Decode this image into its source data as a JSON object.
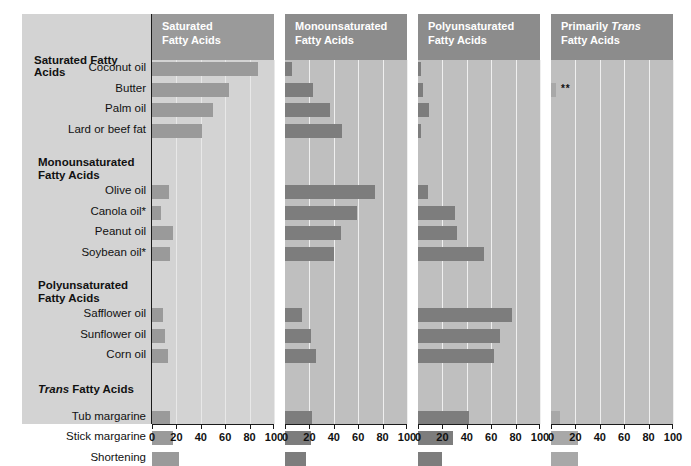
{
  "chart_data": {
    "type": "bar",
    "title": "",
    "orientation": "horizontal",
    "panels": [
      {
        "key": "saturated",
        "title_line1": "Saturated",
        "title_line2": "Fatty Acids",
        "xlabel": "",
        "xlim": [
          0,
          100
        ],
        "ticks": [
          0,
          20,
          40,
          60,
          80,
          100
        ]
      },
      {
        "key": "monounsaturated",
        "title_line1": "Monounsaturated",
        "title_line2": "Fatty Acids",
        "xlabel": "",
        "xlim": [
          0,
          100
        ],
        "ticks": [
          0,
          20,
          40,
          60,
          80,
          100
        ]
      },
      {
        "key": "polyunsaturated",
        "title_line1": "Polyunsaturated",
        "title_line2": "Fatty Acids",
        "xlabel": "",
        "xlim": [
          0,
          100
        ],
        "ticks": [
          0,
          20,
          40,
          60,
          80,
          100
        ]
      },
      {
        "key": "trans",
        "title_line1_pre": "Primarily ",
        "title_line1_italic": "Trans",
        "title_line2": "Fatty Acids",
        "xlabel": "",
        "xlim": [
          0,
          100
        ],
        "ticks": [
          0,
          20,
          40,
          60,
          80,
          100
        ]
      }
    ],
    "groups": [
      {
        "label": "Saturated Fatty Acids",
        "italic_word": "",
        "items": [
          "Coconut oil",
          "Butter",
          "Palm oil",
          "Lard or beef fat"
        ]
      },
      {
        "label": "Monounsaturated Fatty Acids",
        "italic_word": "",
        "items": [
          "Olive oil",
          "Canola oil*",
          "Peanut oil",
          "Soybean oil*"
        ]
      },
      {
        "label": "Polyunsaturated Fatty Acids",
        "italic_word": "",
        "items": [
          "Safflower oil",
          "Sunflower oil",
          "Corn oil"
        ]
      },
      {
        "label": "Trans Fatty Acids",
        "italic_word": "Trans",
        "items": [
          "Tub margarine",
          "Stick margarine",
          "Shortening"
        ]
      }
    ],
    "categories": [
      "Coconut oil",
      "Butter",
      "Palm oil",
      "Lard or beef fat",
      "Olive oil",
      "Canola oil*",
      "Peanut oil",
      "Soybean oil*",
      "Safflower oil",
      "Sunflower oil",
      "Corn oil",
      "Tub margarine",
      "Stick margarine",
      "Shortening"
    ],
    "series": [
      {
        "name": "Saturated Fatty Acids",
        "values": [
          87,
          63,
          50,
          41,
          14,
          7,
          17,
          15,
          9,
          11,
          13,
          15,
          17,
          22
        ]
      },
      {
        "name": "Monounsaturated Fatty Acids",
        "values": [
          6,
          23,
          37,
          47,
          74,
          59,
          46,
          40,
          14,
          21,
          25,
          22,
          21,
          17
        ]
      },
      {
        "name": "Polyunsaturated Fatty Acids",
        "values": [
          2,
          4,
          9,
          2,
          8,
          30,
          32,
          54,
          77,
          67,
          62,
          42,
          29,
          20
        ]
      },
      {
        "name": "Primarily Trans Fatty Acids",
        "values": [
          0,
          4,
          0,
          0,
          0,
          0,
          0,
          0,
          0,
          0,
          0,
          7,
          22,
          22
        ]
      }
    ],
    "annotations": [
      {
        "panel": "trans",
        "category": "Butter",
        "text": "**"
      }
    ],
    "grid": true,
    "legend": "none",
    "colors": {
      "label_panel_bg": "#d3d3d3",
      "panel_bg": "#bfbfbf",
      "panel1_bg": "#d3d3d3",
      "header_bg": "#8c8c8c",
      "header_bg_light": "#9a9a9a",
      "bar": "#7d7d7d",
      "bar_light": "#9a9a9a",
      "bar_trans": "#a8a8a8",
      "gridline": "#efefef",
      "axis": "#1a1a1a",
      "text": "#111111",
      "header_text": "#ffffff"
    }
  }
}
